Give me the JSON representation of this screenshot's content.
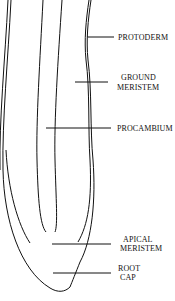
{
  "diagram": {
    "labels": {
      "protoderm": "PROTODERM",
      "ground_meristem_1": "GROUND",
      "ground_meristem_2": "MERISTEM",
      "procambium": "PROCAMBIUM",
      "apical_meristem_1": "APICAL",
      "apical_meristem_2": "MERISTEM",
      "root_cap_1": "ROOT",
      "root_cap_2": "CAP"
    },
    "line_color": "#111111"
  }
}
